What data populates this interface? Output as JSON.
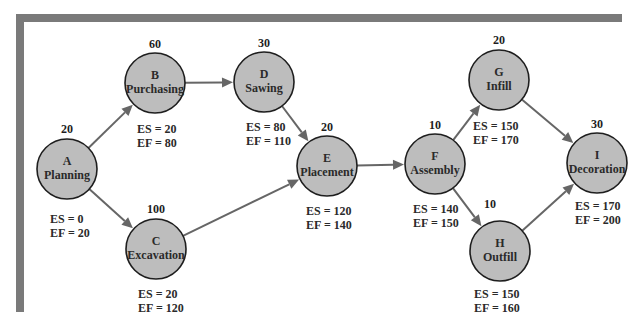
{
  "diagram": {
    "type": "activity-on-node network",
    "colors": {
      "frame": "#7a7a7a",
      "node_fill": "#bdbdbd",
      "node_stroke": "#1e1e1e",
      "edge": "#666666",
      "text": "#2a2a2a"
    },
    "nodes": [
      {
        "id": "A",
        "name": "Planning",
        "duration": "20",
        "es": "ES = 0",
        "ef": "EF = 20",
        "cx": 67,
        "cy": 169,
        "dur_xy": [
          67,
          133
        ],
        "es_xy": [
          50,
          223
        ]
      },
      {
        "id": "B",
        "name": "Purchasing",
        "duration": "60",
        "es": "ES = 20",
        "ef": "EF = 80",
        "cx": 155,
        "cy": 83,
        "dur_xy": [
          155,
          48
        ],
        "es_xy": [
          137,
          133
        ]
      },
      {
        "id": "C",
        "name": "Excavation",
        "duration": "100",
        "es": "ES = 20",
        "ef": "EF = 120",
        "cx": 156,
        "cy": 249,
        "dur_xy": [
          156,
          213
        ],
        "es_xy": [
          138,
          298
        ]
      },
      {
        "id": "D",
        "name": "Sawing",
        "duration": "30",
        "es": "ES = 80",
        "ef": "EF = 110",
        "cx": 264,
        "cy": 82,
        "dur_xy": [
          264,
          47
        ],
        "es_xy": [
          246,
          131
        ]
      },
      {
        "id": "E",
        "name": "Placement",
        "duration": "20",
        "es": "ES = 120",
        "ef": "EF = 140",
        "cx": 327,
        "cy": 166,
        "dur_xy": [
          327,
          131
        ],
        "es_xy": [
          306,
          215
        ]
      },
      {
        "id": "F",
        "name": "Assembly",
        "duration": "10",
        "es": "ES = 140",
        "ef": "EF = 150",
        "cx": 435,
        "cy": 164,
        "dur_xy": [
          435,
          129
        ],
        "es_xy": [
          413,
          213
        ]
      },
      {
        "id": "G",
        "name": "Infill",
        "duration": "20",
        "es": "ES = 150",
        "ef": "EF = 170",
        "cx": 499,
        "cy": 80,
        "dur_xy": [
          499,
          44
        ],
        "es_xy": [
          473,
          130
        ]
      },
      {
        "id": "H",
        "name": "Outfill",
        "duration": "10",
        "es": "ES = 150",
        "ef": "EF = 160",
        "cx": 500,
        "cy": 251,
        "dur_xy": [
          490,
          208
        ],
        "es_xy": [
          474,
          298
        ]
      },
      {
        "id": "I",
        "name": "Decoration",
        "duration": "30",
        "es": "ES = 170",
        "ef": "EF = 200",
        "cx": 597,
        "cy": 163,
        "dur_xy": [
          597,
          128
        ],
        "es_xy": [
          575,
          210
        ]
      }
    ],
    "edges": [
      {
        "from": "A",
        "to": "B"
      },
      {
        "from": "A",
        "to": "C"
      },
      {
        "from": "B",
        "to": "D"
      },
      {
        "from": "D",
        "to": "E"
      },
      {
        "from": "C",
        "to": "E"
      },
      {
        "from": "E",
        "to": "F"
      },
      {
        "from": "F",
        "to": "G"
      },
      {
        "from": "F",
        "to": "H"
      },
      {
        "from": "G",
        "to": "I"
      },
      {
        "from": "H",
        "to": "I"
      }
    ],
    "node_radius": 30
  }
}
